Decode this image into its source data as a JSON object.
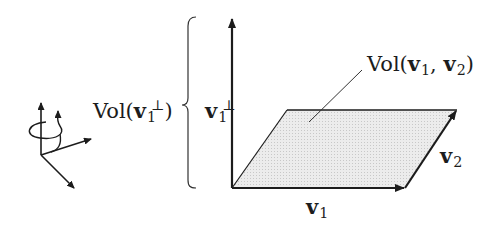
{
  "figure": {
    "labels": {
      "vol_perp": {
        "prefix": "Vol(",
        "vec": "v",
        "sub": "1",
        "sup": "⊥",
        "suffix": ")"
      },
      "axis_label": {
        "vec": "v",
        "sub": "1",
        "sup": "⊥"
      },
      "vol_area": {
        "prefix": "Vol(",
        "vec1": "v",
        "sub1": "1",
        "sep": ", ",
        "vec2": "v",
        "sub2": "2",
        "suffix": ")"
      },
      "v1": {
        "vec": "v",
        "sub": "1"
      },
      "v2": {
        "vec": "v",
        "sub": "2"
      }
    },
    "icons": [
      "rotation-axes-icon",
      "curly-brace",
      "parallelogram"
    ],
    "colors": {
      "stroke": "#1c1c1c",
      "fill": "#e6e6e6",
      "leader": "#333333"
    }
  }
}
